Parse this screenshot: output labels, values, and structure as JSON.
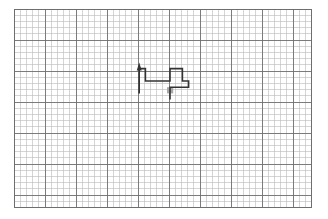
{
  "canvas": {
    "width": 328,
    "height": 219,
    "background_color": "#ffffff"
  },
  "grid": {
    "name": "graph-paper-grid",
    "origin_x": 14,
    "origin_y": 9,
    "cell_size": 6.2,
    "cols": 48,
    "cols_label": "48",
    "rows": 32,
    "rows_label": "32",
    "minor_line_color": "#b9b9b9",
    "minor_line_width": 0.6,
    "major_line_color": "#6e6e6e",
    "major_line_width": 0.9,
    "major_every": 5,
    "border_color": "#6e6e6e",
    "border_width": 1.0
  },
  "path": {
    "name": "orthogonal-route-path",
    "stroke_color": "#333333",
    "stroke_width": 1.6,
    "description": "Orthogonal staircase route ending in an upward arrow on the left and a plus-shaped loop on the right",
    "cells": [
      [
        3,
        9
      ],
      [
        3,
        8
      ],
      [
        5,
        8
      ],
      [
        5,
        9
      ],
      [
        9,
        9
      ],
      [
        9,
        8
      ],
      [
        11,
        8
      ],
      [
        11,
        9
      ],
      [
        13,
        9
      ],
      [
        13,
        8
      ],
      [
        15,
        8
      ],
      [
        15,
        9
      ]
    ],
    "polyline_points": "139.2,93.4 139.2,68.6 145.4,68.6 145.4,81.0 170.0,81.0 170.0,68.6 182.4,68.6 182.4,81.0 188.6,81.0 188.6,87.2 170.0,87.2 170.0,99.6",
    "arrow": {
      "name": "path-arrowhead",
      "direction": "up",
      "tip_x": 139.2,
      "tip_y": 62.5,
      "color": "#333333",
      "points": "139.2,62.5 136.7,70.5 141.7,70.5"
    }
  },
  "marker": {
    "name": "highlighted-cell-marker",
    "fill_color": "#a8a8a8",
    "x": 167.0,
    "y": 87.2,
    "width": 6.2,
    "height": 6.2,
    "grid_col": 25,
    "grid_row": 13,
    "label": ""
  },
  "legend": {
    "items": []
  },
  "labels": {
    "title": "",
    "caption": ""
  }
}
